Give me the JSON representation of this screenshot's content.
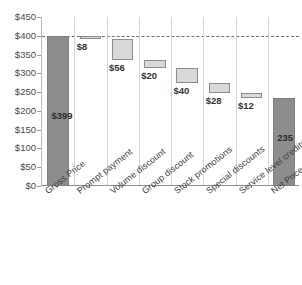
{
  "chart_data": {
    "type": "bar",
    "subtype": "waterfall",
    "title": "",
    "xlabel": "",
    "ylabel": "",
    "ylim": [
      0,
      450
    ],
    "ytick_step": 50,
    "grid": "vertical-category-separators",
    "legend": "none",
    "currency_prefix": "$",
    "categories": [
      "Gross Price",
      "Prompt payment",
      "Volume discount",
      "Group discount",
      "Stock promotions",
      "Special discounts",
      "Service level credits",
      "Net Price"
    ],
    "ytick_labels": [
      "$450",
      "$400",
      "$350",
      "$300",
      "$250",
      "$200",
      "$150",
      "$100",
      "$50",
      "$0"
    ],
    "ytick_values": [
      450,
      400,
      350,
      300,
      250,
      200,
      150,
      100,
      50,
      0
    ],
    "data_labels": [
      "$399",
      "$8",
      "$56",
      "$20",
      "$40",
      "$28",
      "$12",
      "235"
    ],
    "values": [
      399,
      -8,
      -56,
      -20,
      -40,
      -28,
      -12,
      235
    ],
    "magnitudes": [
      399,
      8,
      56,
      20,
      40,
      28,
      12,
      235
    ],
    "cumulative_top": [
      399,
      399,
      391,
      335,
      315,
      275,
      247,
      235
    ],
    "cumulative_bottom": [
      0,
      391,
      335,
      315,
      275,
      247,
      235,
      0
    ],
    "bar_kinds": [
      "total",
      "delta",
      "delta",
      "delta",
      "delta",
      "delta",
      "delta",
      "total"
    ],
    "label_positions": [
      "inside",
      "below",
      "below",
      "below",
      "below",
      "below",
      "below",
      "inside"
    ],
    "reference_line": {
      "value": 399,
      "style": "dashed",
      "label": ""
    },
    "colors": {
      "total_fill": "#8d8d8d",
      "total_stroke": "#7e7e7e",
      "delta_fill": "#d9d9d9",
      "delta_stroke": "#8c8c8c",
      "grid": "#d6d6d6",
      "axis": "#8f8f8f",
      "text": "#3a3a3a",
      "reference_line": "#6f6f6f",
      "background": "#ffffff"
    }
  }
}
